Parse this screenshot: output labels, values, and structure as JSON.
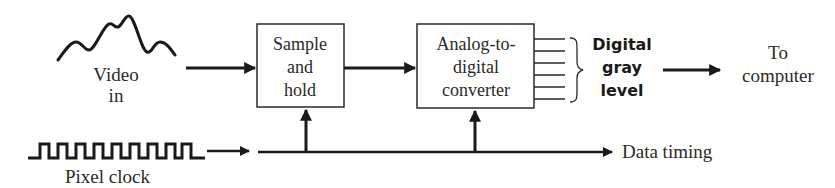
{
  "diagram": {
    "type": "block-diagram",
    "colors": {
      "ink": "#1a1a1a",
      "text": "#2a2a2a",
      "background": "#ffffff"
    },
    "inputs": {
      "video": {
        "icon": "analog-waveform-icon",
        "label_lines": [
          "Video",
          "in"
        ]
      },
      "clock": {
        "icon": "square-wave-icon",
        "label": "Pixel clock",
        "pulses": 8
      }
    },
    "blocks": [
      {
        "id": "sample_hold",
        "label_lines": [
          "Sample",
          "and",
          "hold"
        ]
      },
      {
        "id": "adc",
        "label_lines": [
          "Analog-to-",
          "digital",
          "converter"
        ],
        "output_lines": 6
      }
    ],
    "outputs": {
      "digital": {
        "label_lines": [
          "Digital",
          "gray",
          "level"
        ]
      },
      "destination": {
        "label_lines": [
          "To",
          "computer"
        ]
      },
      "timing": {
        "label": "Data timing"
      }
    },
    "connections": [
      {
        "from": "video",
        "to": "sample_hold"
      },
      {
        "from": "sample_hold",
        "to": "adc"
      },
      {
        "from": "adc",
        "to": "digital"
      },
      {
        "from": "digital",
        "to": "destination"
      },
      {
        "from": "clock",
        "to": "timing-bus"
      },
      {
        "from": "timing-bus",
        "to": "sample_hold"
      },
      {
        "from": "timing-bus",
        "to": "adc"
      },
      {
        "from": "timing-bus",
        "to": "timing"
      }
    ]
  }
}
